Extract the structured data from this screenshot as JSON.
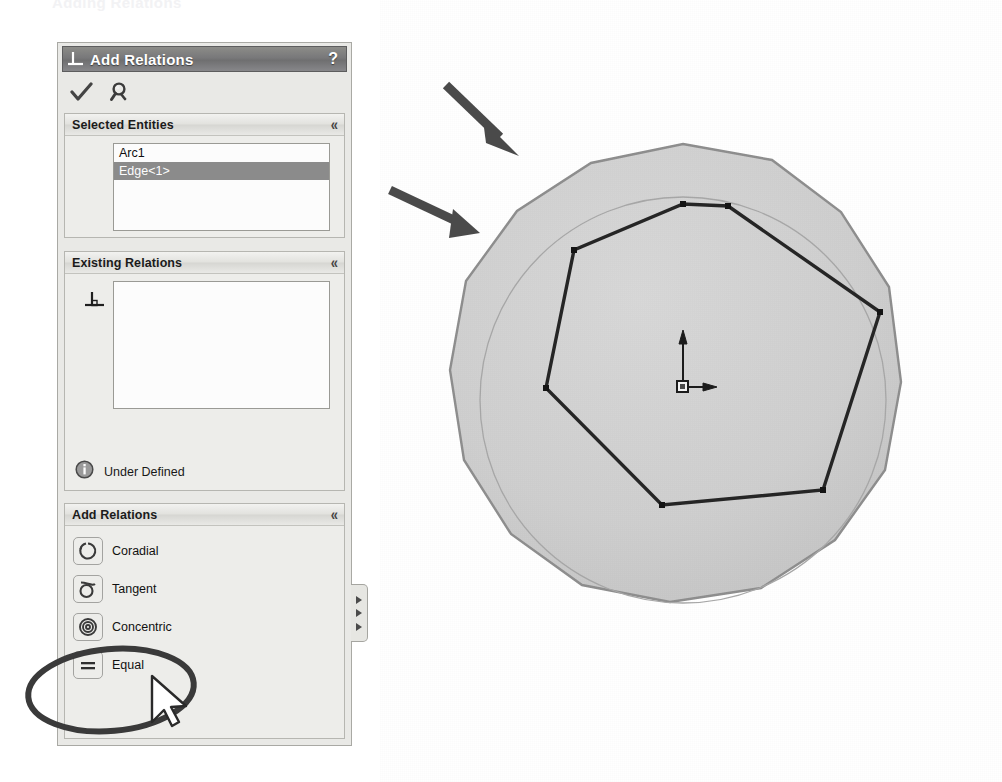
{
  "ghost_heading": "Adding Relations",
  "panel": {
    "title": "Add Relations",
    "title_icon": "perpendicular-relation-icon",
    "help_label": "?",
    "toolbar": {
      "ok_label": "OK",
      "ok_icon": "checkmark-icon",
      "undo_label": "Undo",
      "undo_icon": "undo-magnifier-icon"
    },
    "sections": [
      {
        "id": "selected-entities",
        "title": "Selected Entities",
        "collapse_glyph": "«",
        "items": [
          {
            "label": "Arc1",
            "selected": false
          },
          {
            "label": "Edge<1>",
            "selected": true
          }
        ]
      },
      {
        "id": "existing-relations",
        "title": "Existing Relations",
        "collapse_glyph": "«",
        "icon": "perpendicular-relation-icon",
        "items": [],
        "status": {
          "icon": "info-icon",
          "text": "Under Defined"
        }
      },
      {
        "id": "add-relations",
        "title": "Add Relations",
        "collapse_glyph": "«",
        "buttons": [
          {
            "label": "Coradial",
            "icon": "coradial-icon"
          },
          {
            "label": "Tangent",
            "icon": "tangent-icon"
          },
          {
            "label": "Concentric",
            "icon": "concentric-icon"
          },
          {
            "label": "Equal",
            "icon": "equal-icon"
          }
        ]
      }
    ],
    "splitter": {
      "name": "panel-splitter-tab",
      "arrow_count": 3
    }
  },
  "graphics": {
    "model_name": "circular-plate-with-heptagon-sketch",
    "disc": {
      "center_x": 683,
      "center_y": 400,
      "outer_radius": 256,
      "inner_circle_radius": 203,
      "fill_color": "#cfcfcf",
      "edge_color": "#8f8f8f"
    },
    "sketch": {
      "type": "heptagon",
      "sides": 7,
      "vertex_radius": 196,
      "line_color": "#2b2b2b",
      "vertex_count": 7
    },
    "origin": {
      "label": "sketch-origin",
      "x": 683,
      "y": 387,
      "axes": [
        "x",
        "y"
      ]
    }
  },
  "annotations": {
    "arrows": [
      {
        "name": "arrow-outer-edge",
        "x1": 446,
        "y1": 85,
        "x2": 512,
        "y2": 148,
        "color": "#4a4a4a"
      },
      {
        "name": "arrow-inner-circle",
        "x1": 392,
        "y1": 190,
        "x2": 472,
        "y2": 228,
        "color": "#4a4a4a"
      }
    ],
    "highlight_ellipse": {
      "name": "equal-button-highlight",
      "cx": 111,
      "cy": 690,
      "rx": 83,
      "ry": 41,
      "color": "#3a3a3a"
    },
    "cursor": {
      "name": "mouse-cursor",
      "x": 152,
      "y": 682
    }
  }
}
